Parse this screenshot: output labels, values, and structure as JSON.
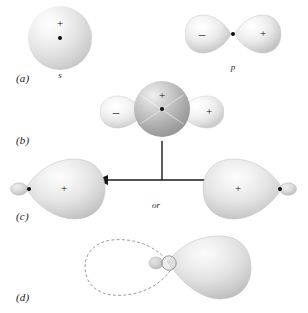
{
  "figure": {
    "background_color": "#ffffff"
  },
  "rows": [
    {
      "id": "a",
      "label": "(a)",
      "description": "An s orbital and a p orbital shown separately",
      "orbitals": [
        {
          "name": "s-orbital",
          "caption": "s",
          "shape": "sphere",
          "signs": [
            "+"
          ],
          "nucleus": true
        },
        {
          "name": "p-orbital",
          "caption": "p",
          "shape": "two-lobes",
          "signs": [
            "-",
            "+"
          ],
          "nucleus": true
        }
      ]
    },
    {
      "id": "b",
      "label": "(b)",
      "description": "The s orbital and p orbital superimposed on the same nucleus",
      "orbitals": [
        {
          "name": "superimposed-s-and-p",
          "caption": "",
          "shape": "sphere-over-two-lobes",
          "signs": [
            "-",
            "+",
            "+"
          ],
          "nucleus": true
        }
      ]
    },
    {
      "id": "c",
      "label": "(c)",
      "description": "Two equivalent sp hybrid orbitals, related by the direction of the large lobe",
      "connector": "or",
      "orbitals": [
        {
          "name": "sp-hybrid-left",
          "caption": "",
          "shape": "hybrid-large-lobe-right",
          "signs": [
            "+"
          ],
          "nucleus": true
        },
        {
          "name": "sp-hybrid-right",
          "caption": "",
          "shape": "hybrid-large-lobe-left",
          "signs": [
            "+"
          ],
          "nucleus": true
        }
      ]
    },
    {
      "id": "d",
      "label": "(d)",
      "description": "The sp hybrid orbital with the cancelled small lobe drawn as a dashed outline",
      "orbitals": [
        {
          "name": "sp-hybrid-with-node-outline",
          "caption": "",
          "shape": "hybrid-with-dashed-back-lobe",
          "signs": [],
          "nucleus": true
        }
      ]
    }
  ],
  "signs": {
    "plus": "+",
    "minus": "–"
  },
  "captions": {
    "s_orbital": "s",
    "p_orbital": "p",
    "or": "or"
  },
  "labels": {
    "a": "(a)",
    "b": "(b)",
    "c": "(c)",
    "d": "(d)"
  },
  "colors": {
    "background": "#ffffff",
    "lobe_light": "#ececec",
    "lobe_edge": "#b8b8b8",
    "sphere_dark": "#a8a8a8",
    "nucleus": "#0d0d0d",
    "arrow": "#1a1a1a",
    "outline_dashed": "#8a8a8a",
    "text": "#1a1a1a"
  }
}
